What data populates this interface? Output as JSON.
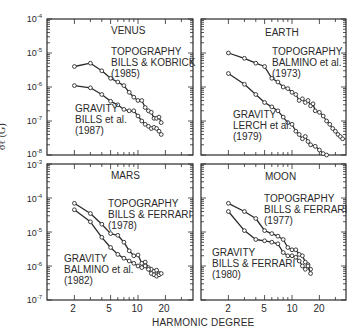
{
  "chart_data": {
    "type": "line",
    "title": "",
    "xlabel": "HARMONIC DEGREE",
    "ylabel": "σℓ (G)",
    "x_scale": "log",
    "y_scale": "log",
    "x_ticks": [
      "2",
      "5",
      "10",
      "20"
    ],
    "grid": false,
    "panels": [
      {
        "id": "venus",
        "title": "VENUS",
        "ylim": [
          1e-08,
          0.0001
        ],
        "y_ticks": [
          "10-4",
          "10-5",
          "10-6",
          "10-7",
          "10-8"
        ],
        "series": [
          {
            "name": "TOPOGRAPHY",
            "source": "BILLS & KOBRICK",
            "year": "(1985)",
            "x": [
              2,
              3,
              4,
              5,
              6,
              7,
              8,
              9,
              10,
              11,
              12,
              13,
              14,
              15,
              16,
              17,
              18
            ],
            "values": [
              4e-06,
              5e-06,
              3e-06,
              1.8e-06,
              1.4e-06,
              1.1e-06,
              7e-07,
              5e-07,
              4e-07,
              4e-07,
              2.5e-07,
              2e-07,
              1.8e-07,
              1.2e-07,
              1.2e-07,
              1.3e-07,
              9e-08
            ]
          },
          {
            "name": "GRAVITY",
            "source": "BILLS et al.",
            "year": "(1987)",
            "x": [
              2,
              3,
              4,
              5,
              6,
              7,
              8,
              9,
              10,
              11,
              12,
              13,
              14,
              15,
              16,
              17,
              18
            ],
            "values": [
              1.1e-06,
              9.5e-07,
              6e-07,
              3.8e-07,
              3e-07,
              2.2e-07,
              2e-07,
              2e-07,
              1.4e-07,
              1e-07,
              8e-08,
              7e-08,
              6e-08,
              6.5e-08,
              6e-08,
              5e-08,
              4e-08
            ]
          }
        ]
      },
      {
        "id": "earth",
        "title": "EARTH",
        "ylim": [
          1e-08,
          0.0001
        ],
        "y_ticks": [],
        "series": [
          {
            "name": "TOPOGRAPHY",
            "source": "BALMINO et al.",
            "year": "(1973)",
            "x": [
              2,
              3,
              4,
              5,
              6,
              7,
              8,
              9,
              10,
              11,
              12,
              13,
              14,
              15,
              16,
              17,
              18,
              20,
              22,
              24,
              26,
              28,
              30,
              32,
              34,
              36
            ],
            "values": [
              1e-05,
              7e-06,
              5e-06,
              4e-06,
              1.8e-06,
              1.4e-06,
              1e-06,
              9e-07,
              7e-07,
              6e-07,
              4e-07,
              4.5e-07,
              3.5e-07,
              4e-07,
              2.8e-07,
              3.2e-07,
              2e-07,
              1.8e-07,
              1.4e-07,
              1e-07,
              8e-08,
              6e-08,
              5e-08,
              4e-08,
              3.5e-08,
              3e-08
            ]
          },
          {
            "name": "GRAVITY",
            "source": "LERCH et al.",
            "year": "(1979)",
            "x": [
              2,
              3,
              4,
              5,
              6,
              7,
              8,
              9,
              10,
              11,
              12,
              13,
              14,
              15,
              16,
              18,
              20,
              22,
              24
            ],
            "values": [
              2.5e-06,
              1.2e-06,
              6e-07,
              3.5e-07,
              2.6e-07,
              2e-07,
              1.3e-07,
              9e-08,
              8e-08,
              5e-08,
              4e-08,
              3e-08,
              3.5e-08,
              2.5e-08,
              2e-08,
              1.8e-08,
              1.4e-08,
              1.1e-08,
              1e-08
            ]
          }
        ]
      },
      {
        "id": "mars",
        "title": "MARS",
        "ylim": [
          1e-07,
          0.001
        ],
        "y_ticks": [
          "10-3",
          "10-4",
          "10-5",
          "10-6",
          "10-7"
        ],
        "series": [
          {
            "name": "TOPOGRAPHY",
            "source": "BILLS & FERRARI",
            "year": "(1978)",
            "x": [
              2,
              3,
              4,
              5,
              6,
              7,
              8,
              9,
              10,
              11,
              12,
              13,
              14,
              15,
              16,
              17
            ],
            "values": [
              7e-05,
              3.5e-05,
              1.7e-05,
              9e-06,
              8e-06,
              5e-06,
              2.8e-06,
              2e-06,
              2.1e-06,
              1.2e-06,
              1.3e-06,
              9e-07,
              8e-07,
              7e-07,
              7.5e-07,
              6e-07
            ]
          },
          {
            "name": "GRAVITY",
            "source": "BALMINO et al.",
            "year": "(1982)",
            "x": [
              2,
              3,
              4,
              5,
              6,
              7,
              8,
              9,
              10,
              11,
              12,
              13,
              14,
              15,
              16,
              17,
              18
            ],
            "values": [
              4.5e-05,
              2e-05,
              7e-06,
              3.5e-06,
              2.2e-06,
              1.7e-06,
              1.4e-06,
              1.2e-06,
              1e-06,
              9e-07,
              1e-06,
              8e-07,
              6e-07,
              5.5e-07,
              5e-07,
              5.5e-07,
              6e-07
            ]
          }
        ]
      },
      {
        "id": "moon",
        "title": "MOON",
        "ylim": [
          1e-07,
          0.001
        ],
        "y_ticks": [],
        "series": [
          {
            "name": "TOPOGRAPHY",
            "source": "BILLS & FERRARI",
            "year": "(1977)",
            "x": [
              2,
              3,
              4,
              5,
              6,
              7,
              8,
              9,
              10,
              11,
              12,
              13,
              14,
              15,
              16
            ],
            "values": [
              7e-05,
              4e-05,
              2.5e-05,
              1.1e-05,
              9e-06,
              7.5e-06,
              6e-06,
              3.5e-06,
              3e-06,
              3e-06,
              2.2e-06,
              2e-06,
              1.3e-06,
              1.1e-06,
              8e-07
            ]
          },
          {
            "name": "GRAVITY",
            "source": "BILLS & FERRARI",
            "year": "(1980)",
            "x": [
              2,
              3,
              4,
              5,
              6,
              7,
              8,
              9,
              10,
              11,
              12,
              13,
              14,
              15,
              16
            ],
            "values": [
              4e-05,
              1.1e-05,
              6e-06,
              5.5e-06,
              5e-06,
              4.5e-06,
              2.5e-06,
              2e-06,
              2e-06,
              1.8e-06,
              1.4e-06,
              1e-06,
              8e-07,
              1e-06,
              6e-07
            ]
          }
        ]
      }
    ]
  },
  "labels": {
    "venus_title": "VENUS",
    "venus_topo_1": "TOPOGRAPHY",
    "venus_topo_2": "BILLS & KOBRICK",
    "venus_topo_3": "(1985)",
    "venus_grav_1": "GRAVITY",
    "venus_grav_2": "BILLS et al.",
    "venus_grav_3": "(1987)",
    "earth_title": "EARTH",
    "earth_topo_1": "TOPOGRAPHY",
    "earth_topo_2": "BALMINO et al.",
    "earth_topo_3": "(1973)",
    "earth_grav_1": "GRAVITY",
    "earth_grav_2": "LERCH et al.",
    "earth_grav_3": "(1979)",
    "mars_title": "MARS",
    "mars_topo_1": "TOPOGRAPHY",
    "mars_topo_2": "BILLS & FERRARI",
    "mars_topo_3": "(1978)",
    "mars_grav_1": "GRAVITY",
    "mars_grav_2": "BALMINO et al.",
    "mars_grav_3": "(1982)",
    "moon_title": "MOON",
    "moon_topo_1": "TOPOGRAPHY",
    "moon_topo_2": "BILLS & FERRARI",
    "moon_topo_3": "(1977)",
    "moon_grav_1": "GRAVITY",
    "moon_grav_2": "BILLS & FERRARI",
    "moon_grav_3": "(1980)",
    "ylabel_main": "σℓ (G)",
    "xlabel": "HARMONIC DEGREE",
    "ytick_base": "10",
    "top_exps": [
      "-4",
      "-5",
      "-6",
      "-7",
      "-8"
    ],
    "bottom_exps": [
      "-3",
      "-4",
      "-5",
      "-6",
      "-7"
    ],
    "xticks": [
      "2",
      "5",
      "10",
      "20"
    ]
  },
  "colors": {
    "ink": "#2a2a2a",
    "background": "#ffffff"
  }
}
